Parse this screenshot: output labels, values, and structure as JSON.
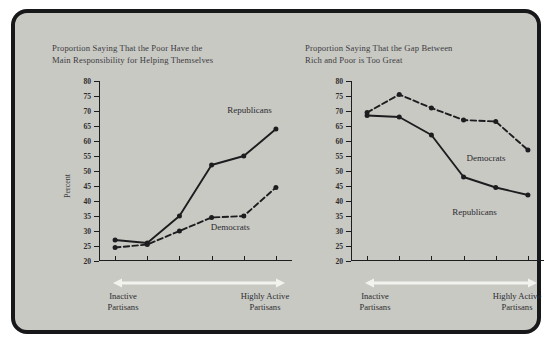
{
  "figure": {
    "background_color": "#c9c9c4",
    "border_color": "#17181a",
    "axis_label_left": "Percent"
  },
  "chart_data": [
    {
      "type": "line",
      "title": "Proportion Saying That the Poor Have the\nMain Responsibility for Helping Themselves",
      "xlabel": "",
      "ylabel": "Percent",
      "ylim": [
        20,
        80
      ],
      "yticks": [
        20,
        25,
        30,
        35,
        40,
        45,
        50,
        55,
        60,
        65,
        70,
        75,
        80
      ],
      "grid": false,
      "x": [
        1,
        2,
        3,
        4,
        5,
        6
      ],
      "x_axis_start_label": "Inactive\nPartisans",
      "x_axis_end_label": "Highly Active\nPartisans",
      "legend_position": "inline-annotations",
      "series": [
        {
          "name": "Republicans",
          "style": "solid",
          "values": [
            27,
            26,
            35,
            52,
            55,
            64
          ],
          "label_x_pct": 78,
          "label_y_value": 70
        },
        {
          "name": "Democrats",
          "style": "dashed",
          "values": [
            24.5,
            25.5,
            30,
            34.5,
            35,
            44.5
          ],
          "label_x_pct": 68,
          "label_y_value": 31
        }
      ]
    },
    {
      "type": "line",
      "title": "Proportion Saying That the Gap Between\nRich and Poor is Too Great",
      "xlabel": "",
      "ylabel": "",
      "ylim": [
        20,
        80
      ],
      "yticks": [
        20,
        25,
        30,
        35,
        40,
        45,
        50,
        55,
        60,
        65,
        70,
        75,
        80
      ],
      "grid": false,
      "x": [
        1,
        2,
        3,
        4,
        5,
        6
      ],
      "x_axis_start_label": "Inactive\nPartisans",
      "x_axis_end_label": "Highly Active\nPartisans",
      "legend_position": "inline-annotations",
      "series": [
        {
          "name": "Democrats",
          "style": "dashed",
          "values": [
            69.5,
            75.5,
            71,
            67,
            66.5,
            57
          ],
          "label_x_pct": 70,
          "label_y_value": 54
        },
        {
          "name": "Republicans",
          "style": "solid",
          "values": [
            68.5,
            68,
            62,
            48,
            44.5,
            42
          ],
          "label_x_pct": 64,
          "label_y_value": 36
        }
      ]
    }
  ]
}
